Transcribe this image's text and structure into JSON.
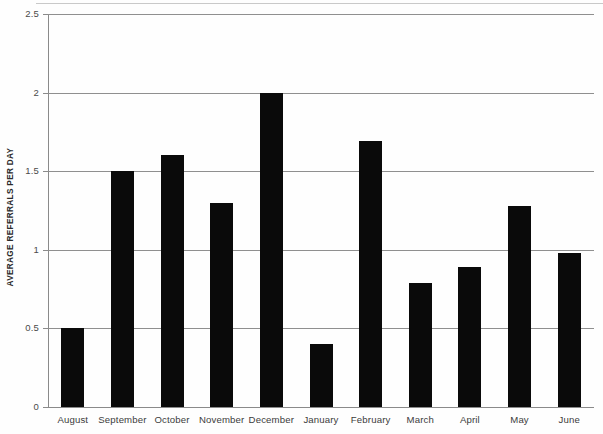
{
  "chart_data": {
    "type": "bar",
    "title": "",
    "subtitle": "",
    "xlabel": "",
    "ylabel": "AVERAGE REFERRALS PER DAY",
    "categories": [
      "August",
      "September",
      "October",
      "November",
      "December",
      "January",
      "February",
      "March",
      "April",
      "May",
      "June"
    ],
    "values": [
      0.5,
      1.5,
      1.6,
      1.3,
      2.0,
      0.4,
      1.69,
      0.79,
      0.89,
      1.28,
      0.98
    ],
    "ylim": [
      0,
      2.5
    ],
    "yticks": [
      0,
      0.5,
      1,
      1.5,
      2,
      2.5
    ],
    "ytick_labels": [
      "0",
      "0.5",
      "1",
      "1.5",
      "2",
      "2.5"
    ],
    "grid": true,
    "grid_axis": "y",
    "legend": false,
    "legend_position": "none",
    "bar_color": "#0a0a0a",
    "grid_color": "#8f8f8f",
    "axis_color": "#8a8a8a",
    "background_color": "#fefefe",
    "series": [
      {
        "name": "Average referrals per day",
        "values": [
          0.5,
          1.5,
          1.6,
          1.3,
          2.0,
          0.4,
          1.69,
          0.79,
          0.89,
          1.28,
          0.98
        ]
      }
    ]
  }
}
